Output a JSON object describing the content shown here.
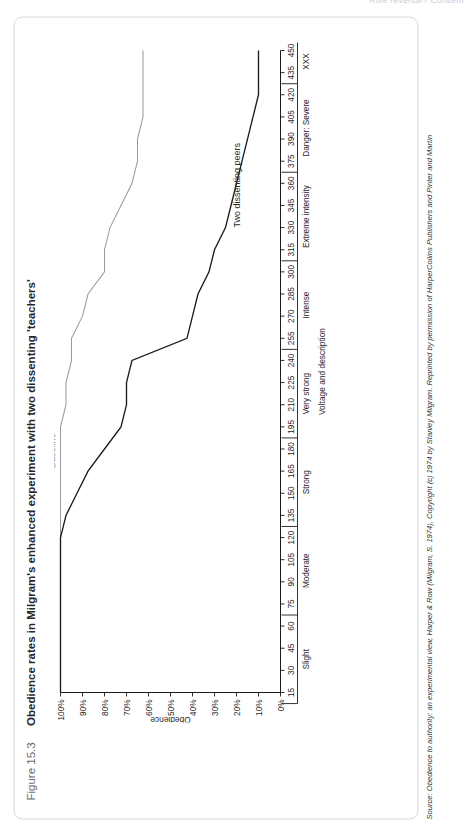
{
  "page": {
    "header_sliver": "Role reversal? Consent"
  },
  "figure": {
    "number": "Figure 15.3",
    "title": "Obedience rates in Milgram's enhanced experiment with two dissenting 'teachers'",
    "source_lead": "Source:",
    "source_text": "Obedience to authority: an experimental view, Harper & Row (Milgram, S. 1974), Copyright (c) 1974 by Stanley Milgram. Reprinted by permission of HarperCollins Publishers and Pinter and Martin"
  },
  "chart_data": {
    "type": "line",
    "title": "Obedience rates in Milgram's enhanced experiment with two dissenting 'teachers'",
    "xlabel": "Voltage and description",
    "ylabel": "Obedience",
    "xlim": [
      15,
      450
    ],
    "ylim": [
      0,
      100
    ],
    "grid": false,
    "legend": "inline-labels",
    "x_tick_labels": [
      "15",
      "30",
      "45",
      "60",
      "75",
      "90",
      "105",
      "120",
      "135",
      "150",
      "165",
      "180",
      "195",
      "210",
      "225",
      "240",
      "255",
      "270",
      "285",
      "300",
      "315",
      "330",
      "345",
      "360",
      "375",
      "390",
      "405",
      "420",
      "435",
      "450"
    ],
    "y_tick_labels": [
      "0%",
      "10%",
      "20%",
      "30%",
      "40%",
      "50%",
      "60%",
      "70%",
      "80%",
      "90%",
      "100%"
    ],
    "x_categories": [
      {
        "label": "Slight",
        "from": 15,
        "to": 60
      },
      {
        "label": "Moderate",
        "from": 75,
        "to": 120
      },
      {
        "label": "Strong",
        "from": 135,
        "to": 180
      },
      {
        "label": "Very strong",
        "from": 195,
        "to": 240
      },
      {
        "label": "Intense",
        "from": 255,
        "to": 300
      },
      {
        "label": "Extreme intensity",
        "from": 315,
        "to": 360
      },
      {
        "label": "Danger: Severe",
        "from": 375,
        "to": 420
      },
      {
        "label": "XXX",
        "from": 435,
        "to": 450
      }
    ],
    "x": [
      15,
      30,
      45,
      60,
      75,
      90,
      105,
      120,
      135,
      150,
      165,
      180,
      195,
      210,
      225,
      240,
      255,
      270,
      285,
      300,
      315,
      330,
      345,
      360,
      375,
      390,
      405,
      420,
      435,
      450
    ],
    "series": [
      {
        "name": "Baseline",
        "color": "#9a9a9e",
        "values": [
          100,
          100,
          100,
          100,
          100,
          100,
          100,
          100,
          100,
          100,
          100,
          100,
          100,
          97.5,
          97.5,
          95,
          95,
          90,
          87.5,
          80,
          80,
          77.5,
          72.5,
          67.5,
          65,
          65,
          62.5,
          62.5,
          62.5,
          62.5
        ]
      },
      {
        "name": "Two dissenting peers",
        "color": "#1b1b1e",
        "values": [
          100,
          100,
          100,
          100,
          100,
          100,
          100,
          100,
          97.5,
          92.5,
          87.5,
          80,
          72.5,
          70,
          70,
          67.5,
          42.5,
          40,
          37.5,
          32.5,
          30,
          25,
          22.5,
          20,
          17.5,
          15,
          12.5,
          10,
          10,
          10
        ]
      }
    ],
    "annotations": [
      {
        "text": "Baseline",
        "series": "Baseline"
      },
      {
        "text": "Two dissenting peers",
        "series": "Two dissenting peers"
      }
    ]
  }
}
